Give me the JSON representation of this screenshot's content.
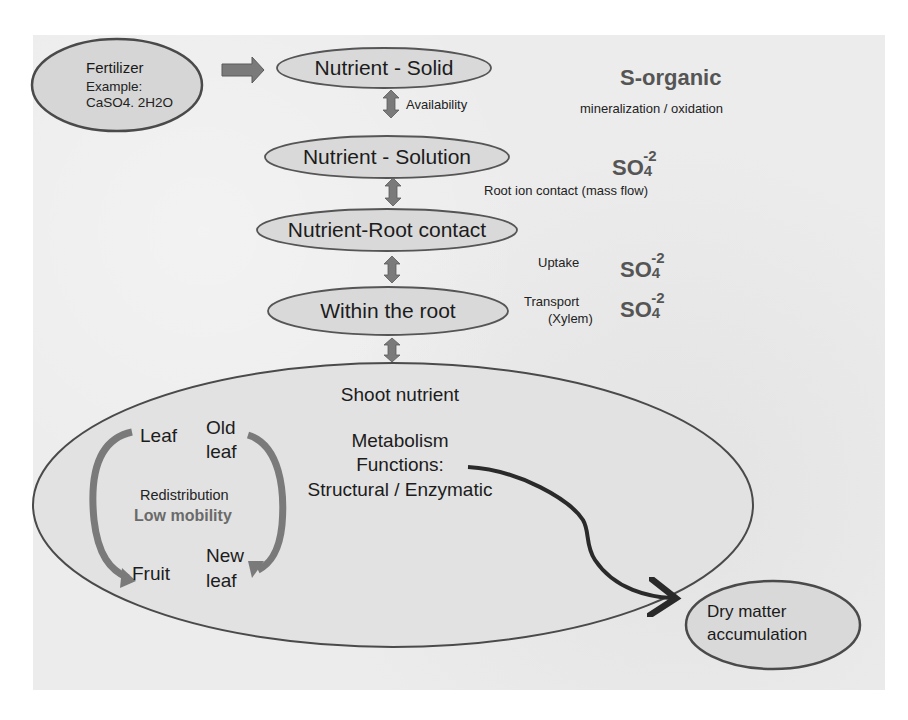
{
  "colors": {
    "background": "#ffffff",
    "panel": "#ececec",
    "ellipse_fill": "#d9d9d9",
    "ellipse_stroke": "#555555",
    "block_arrow": "#7a7a7a",
    "dark_arrow": "#2a2a2a",
    "chem_text": "#555555"
  },
  "fertilizer": {
    "title": "Fertilizer",
    "example_label": "Example:",
    "example_formula": "CaSO4. 2H2O"
  },
  "stages": [
    {
      "id": "solid",
      "label": "Nutrient - Solid"
    },
    {
      "id": "solution",
      "label": "Nutrient - Solution"
    },
    {
      "id": "root_contact",
      "label": "Nutrient-Root contact"
    },
    {
      "id": "within_root",
      "label": "Within the root"
    }
  ],
  "transitions": [
    {
      "label": "Availability",
      "icon": "double-arrow-icon"
    },
    {
      "label": "Root ion contact  (mass flow)",
      "icon": "double-arrow-icon"
    },
    {
      "label": "Uptake",
      "icon": "double-arrow-icon"
    },
    {
      "label": "Transport",
      "sublabel": "(Xylem)",
      "icon": "double-arrow-icon"
    }
  ],
  "side_annotations": {
    "s_organic": "S-organic",
    "mineralization": "mineralization / oxidation",
    "sulfate": {
      "base": "SO",
      "subscript": "4",
      "charge": "-2"
    }
  },
  "shoot": {
    "title": "Shoot nutrient",
    "metabolism_lines": [
      "Metabolism",
      "Functions:",
      "Structural / Enzymatic"
    ],
    "redistribution": {
      "leaf": "Leaf",
      "old_leaf_1": "Old",
      "old_leaf_2": "leaf",
      "fruit": "Fruit",
      "new_leaf_1": "New",
      "new_leaf_2": "leaf",
      "label": "Redistribution",
      "mobility": "Low mobility"
    }
  },
  "output": {
    "line1": "Dry matter",
    "line2": "accumulation"
  }
}
